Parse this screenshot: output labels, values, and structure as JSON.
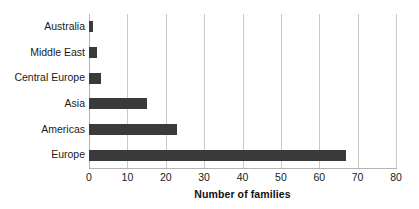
{
  "chart_data": {
    "type": "bar",
    "orientation": "horizontal",
    "title": "",
    "xlabel": "Number of families",
    "ylabel": "",
    "categories": [
      "Europe",
      "Americas",
      "Asia",
      "Central Europe",
      "Middle East",
      "Australia"
    ],
    "values": [
      67,
      23,
      15,
      3,
      2,
      1
    ],
    "series": [
      {
        "name": "Number of families",
        "values": [
          67,
          23,
          15,
          3,
          2,
          1
        ]
      }
    ],
    "xlim": [
      0,
      80
    ],
    "xticks": [
      0,
      10,
      20,
      30,
      40,
      50,
      60,
      70,
      80
    ],
    "xtick_labels": [
      "0",
      "10",
      "20",
      "30",
      "40",
      "50",
      "60",
      "70",
      "80"
    ],
    "grid": "vertical",
    "legend": "none",
    "bar_color": "#3a3a3a",
    "gridline_color": "#c8c8c8",
    "background_color": "#ffffff",
    "text_color": "#1a1a1a"
  }
}
